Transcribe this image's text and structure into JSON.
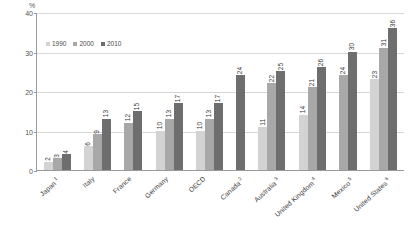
{
  "chart_data": {
    "type": "bar",
    "title": "",
    "xlabel": "",
    "ylabel": "%",
    "ylim": [
      0,
      40
    ],
    "yticks": [
      0,
      10,
      20,
      30,
      40
    ],
    "grid": true,
    "legend_position": "top-left",
    "categories": [
      "Japan",
      "Italy",
      "France",
      "Germany",
      "OECD",
      "Canada",
      "Australia",
      "United Kingdom",
      "Mexico",
      "United States"
    ],
    "category_footnotes": [
      "1",
      "",
      "",
      "",
      "",
      "2",
      "3",
      "4",
      "5",
      "6"
    ],
    "series": [
      {
        "name": "1990",
        "color": "#d3d3d3",
        "values": [
          2,
          6,
          null,
          10,
          10,
          null,
          11,
          14,
          null,
          23
        ]
      },
      {
        "name": "2000",
        "color": "#a8a8a8",
        "values": [
          3,
          9,
          12,
          13,
          13,
          null,
          22,
          21,
          24,
          31
        ]
      },
      {
        "name": "2010",
        "color": "#6e6e6e",
        "values": [
          4,
          13,
          15,
          17,
          17,
          24,
          25,
          26,
          30,
          36
        ]
      }
    ]
  },
  "axis": {
    "unit": "%"
  },
  "colors": {
    "series_1990": "#d3d3d3",
    "series_2000": "#a8a8a8",
    "series_2010": "#6e6e6e",
    "gridline": "#d8d8d8",
    "axis": "#9a9a9a"
  }
}
